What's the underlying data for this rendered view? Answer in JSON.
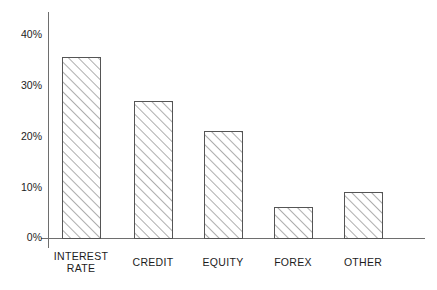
{
  "chart_data": {
    "type": "bar",
    "title": "",
    "subtitle": "",
    "xlabel": "",
    "ylabel": "",
    "categories": [
      "INTEREST RATE",
      "CREDIT",
      "EQUITY",
      "FOREX",
      "OTHER"
    ],
    "values": [
      35.5,
      27.0,
      21.0,
      6.0,
      9.0
    ],
    "value_labels": [
      "35.5%",
      "27%",
      "21%",
      "6%",
      "9%"
    ],
    "ylim": [
      0,
      42
    ],
    "yticks": [
      0,
      10,
      20,
      30,
      40
    ],
    "ytick_labels": [
      "0%",
      "10%",
      "20%",
      "30%",
      "40%"
    ],
    "grid": false,
    "legend": "none",
    "bar_fill": "hatched-diagonal",
    "bar_edge_color": "#555555",
    "axis_color": "#6e6e6e",
    "background_color": "#ffffff"
  },
  "axis": {
    "y_labels": [
      {
        "text": "40%",
        "value": 40
      },
      {
        "text": "30%",
        "value": 30
      },
      {
        "text": "20%",
        "value": 20
      },
      {
        "text": "10%",
        "value": 10
      },
      {
        "text": "0%",
        "value": 0
      }
    ]
  },
  "bars": [
    {
      "label_line1": "INTEREST",
      "label_line2": "RATE",
      "value": 35.5
    },
    {
      "label_line1": "CREDIT",
      "label_line2": "",
      "value": 27.0
    },
    {
      "label_line1": "EQUITY",
      "label_line2": "",
      "value": 21.0
    },
    {
      "label_line1": "FOREX",
      "label_line2": "",
      "value": 6.0
    },
    {
      "label_line1": "OTHER",
      "label_line2": "",
      "value": 9.0
    }
  ]
}
